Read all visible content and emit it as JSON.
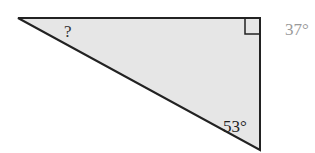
{
  "diagram": {
    "type": "right-triangle",
    "labels": {
      "unknown_angle": "?",
      "bottom_angle": "53°",
      "side_angle": "37°"
    },
    "colors": {
      "fill": "#e6e6e6",
      "stroke": "#222222",
      "faded_label": "#9a9a9a"
    }
  }
}
